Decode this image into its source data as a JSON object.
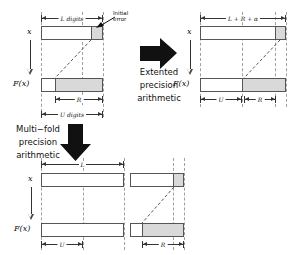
{
  "figure": {
    "colors": {
      "bar_stroke": "#555555",
      "shade_fill": "#d9d9d9",
      "guide_dashed": "#9aa0a6",
      "arrow_fill": "#111111",
      "text": "#111111"
    }
  },
  "panels": {
    "original": {
      "name": "original-precision-panel",
      "row_labels": {
        "input": "x",
        "output": "F(x)"
      },
      "dimensions": {
        "top": "L digits",
        "inner": "R",
        "bottom": "U digits"
      },
      "annotation": {
        "line1": "Initial",
        "line2": "error"
      }
    },
    "extended": {
      "name": "extended-precision-panel",
      "row_labels": {
        "input": "x",
        "output": "F(x)"
      },
      "dimensions": {
        "top": "L + R + α",
        "bottom_left": "U",
        "bottom_right": "R"
      }
    },
    "multifold": {
      "name": "multifold-precision-panel",
      "row_labels": {
        "input": "x",
        "output": "F(x)"
      },
      "dimensions": {
        "top": "L",
        "bottom_left": "U",
        "bottom_right": "R"
      }
    }
  },
  "flows": {
    "extended": {
      "name": "extended-precision-flow",
      "line1": "Extented",
      "line2": "precision",
      "line3": "arithmetic",
      "arrow": "right-block-arrow"
    },
    "multifold": {
      "name": "multifold-precision-flow",
      "line1": "Multi−fold",
      "line2": "precision",
      "line3": "arithmetic",
      "arrow": "down-block-arrow"
    }
  }
}
